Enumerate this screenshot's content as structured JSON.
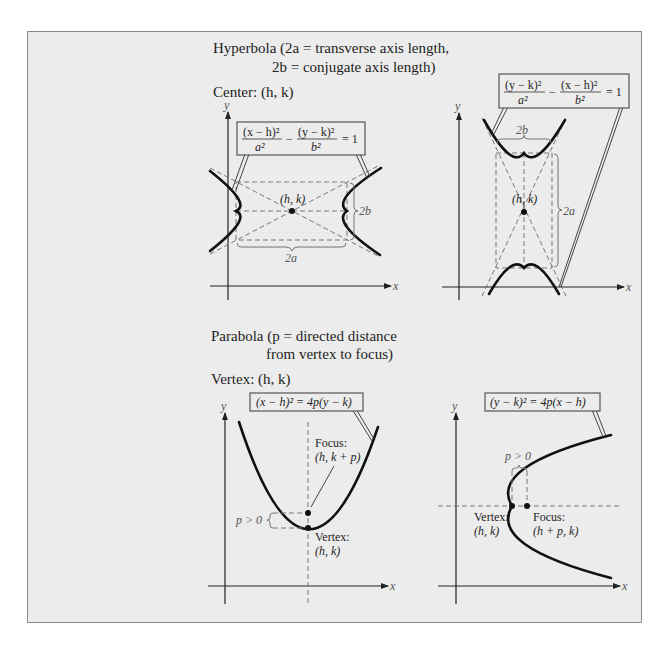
{
  "hyperbola": {
    "heading_line1": "Hyperbola (2a = transverse axis length,",
    "heading_line2": "2b = conjugate axis length)",
    "center_label": "Center: (h, k)",
    "horizontal": {
      "equation_num1": "(x − h)²",
      "equation_den1": "a²",
      "equation_num2": "(y − k)²",
      "equation_den2": "b²",
      "equation_rhs": "= 1",
      "minus": "−",
      "center_point": "(h, k)",
      "transverse_label": "2a",
      "conjugate_label": "2b",
      "x_axis": "x",
      "y_axis": "y"
    },
    "vertical": {
      "equation_num1": "(y − k)²",
      "equation_den1": "a²",
      "equation_num2": "(x − h)²",
      "equation_den2": "b²",
      "equation_rhs": "= 1",
      "minus": "−",
      "center_point": "(h, k)",
      "transverse_label": "2a",
      "conjugate_label": "2b",
      "x_axis": "x",
      "y_axis": "y"
    }
  },
  "parabola": {
    "heading_line1": "Parabola (p = directed distance",
    "heading_line2": "from vertex to focus)",
    "vertex_label": "Vertex: (h, k)",
    "vertical": {
      "equation": "(x − h)² = 4p(y − k)",
      "focus_title": "Focus:",
      "focus_coords": "(h, k + p)",
      "vertex_title": "Vertex:",
      "vertex_coords": "(h, k)",
      "p_label": "p > 0",
      "x_axis": "x",
      "y_axis": "y"
    },
    "horizontal": {
      "equation": "(y − k)² = 4p(x − h)",
      "focus_title": "Focus:",
      "focus_coords": "(h + p, k)",
      "vertex_title": "Vertex:",
      "vertex_coords": "(h, k)",
      "p_label": "p > 0",
      "x_axis": "x",
      "y_axis": "y"
    }
  }
}
